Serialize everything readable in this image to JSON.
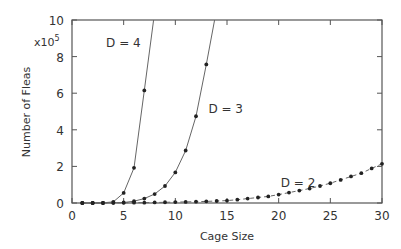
{
  "chart_data": {
    "type": "line",
    "title": "",
    "xlabel": "Cage Size",
    "ylabel": "Number of Fleas",
    "y_multiplier": "x10",
    "y_multiplier_exp": "5",
    "xlim": [
      0,
      30
    ],
    "ylim": [
      0,
      10
    ],
    "xticks": [
      0,
      5,
      10,
      15,
      20,
      25,
      30
    ],
    "yticks": [
      0,
      2,
      4,
      6,
      8,
      10
    ],
    "grid": false,
    "legend": "inline labels",
    "series": [
      {
        "name": "D = 4",
        "label_pos": [
          3.3,
          8.5
        ],
        "style": "solid",
        "x": [
          1,
          2,
          3,
          4,
          5,
          6,
          7
        ],
        "values": [
          0.0,
          0.0,
          0.01,
          0.06,
          0.55,
          1.92,
          6.15
        ],
        "curve_end": [
          7.9,
          10
        ]
      },
      {
        "name": "D = 3",
        "label_pos": [
          13.2,
          4.9
        ],
        "style": "solid",
        "x": [
          1,
          2,
          3,
          4,
          5,
          6,
          7,
          8,
          9,
          10,
          11,
          12,
          13
        ],
        "values": [
          0.0,
          0.0,
          0.0,
          0.01,
          0.03,
          0.1,
          0.24,
          0.49,
          0.93,
          1.67,
          2.87,
          4.74,
          7.57
        ],
        "curve_end": [
          13.8,
          10
        ]
      },
      {
        "name": "D = 2",
        "label_pos": [
          20.2,
          0.9
        ],
        "style": "dashed",
        "x": [
          1,
          2,
          3,
          4,
          5,
          6,
          7,
          8,
          9,
          10,
          11,
          12,
          13,
          14,
          15,
          16,
          17,
          18,
          19,
          20,
          21,
          22,
          23,
          24,
          25,
          26,
          27,
          28,
          29,
          30
        ],
        "values": [
          0.0,
          0.0,
          0.0,
          0.01,
          0.01,
          0.02,
          0.02,
          0.03,
          0.04,
          0.05,
          0.06,
          0.07,
          0.09,
          0.11,
          0.13,
          0.18,
          0.24,
          0.3,
          0.36,
          0.46,
          0.57,
          0.68,
          0.79,
          0.93,
          1.08,
          1.26,
          1.45,
          1.63,
          1.89,
          2.14
        ]
      }
    ]
  },
  "colors": {
    "axis": "#555555",
    "line": "#666666",
    "marker": "#222222",
    "text": "#333333"
  }
}
